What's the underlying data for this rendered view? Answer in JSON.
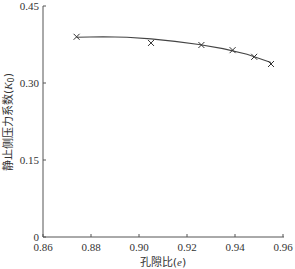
{
  "chart_data": {
    "type": "scatter",
    "title": "",
    "xlabel": "孔隙比(e)",
    "ylabel": "静止侧压力系数(K0)",
    "xlim": [
      0.86,
      0.96
    ],
    "ylim": [
      0,
      0.45
    ],
    "x_ticks": [
      "0.86",
      "0.88",
      "0.90",
      "0.92",
      "0.94",
      "0.96"
    ],
    "y_ticks": [
      "0",
      "0.15",
      "0.30",
      "0.45"
    ],
    "grid": false,
    "legend": null,
    "series": [
      {
        "name": "measured",
        "marker": "x",
        "x": [
          0.874,
          0.905,
          0.926,
          0.939,
          0.948,
          0.955
        ],
        "y": [
          0.39,
          0.378,
          0.374,
          0.364,
          0.351,
          0.337
        ]
      },
      {
        "name": "fitted curve",
        "style": "line",
        "x": [
          0.874,
          0.885,
          0.895,
          0.905,
          0.915,
          0.925,
          0.935,
          0.945,
          0.955
        ],
        "y": [
          0.389,
          0.39,
          0.389,
          0.386,
          0.381,
          0.375,
          0.367,
          0.356,
          0.34
        ]
      }
    ]
  },
  "axes": {
    "x_title_prefix": "孔隙比(",
    "x_title_var": "e",
    "x_title_suffix": ")",
    "y_title_prefix": "静止侧压力系数(",
    "y_title_var": "K",
    "y_title_sub": "0",
    "y_title_suffix": ")"
  }
}
